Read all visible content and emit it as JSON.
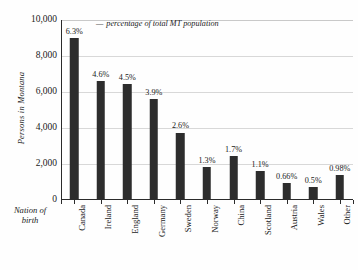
{
  "chart_data": {
    "type": "bar",
    "title": "",
    "xlabel": "Nation of birth",
    "ylabel": "Persons in Montana",
    "ylim": [
      0,
      10000
    ],
    "ytick_labels": [
      "10,000",
      "8,000",
      "6,000",
      "4,000",
      "2,000",
      "0"
    ],
    "ytick_values": [
      10000,
      8000,
      6000,
      4000,
      2000,
      0
    ],
    "grid": true,
    "legend_position": "inside-top-left",
    "annotation": "percentage of total MT population",
    "annotation_dash": "—",
    "categories": [
      "Canada",
      "Ireland",
      "England",
      "Germany",
      "Sweden",
      "Norway",
      "China",
      "Scotland",
      "Austria",
      "Wales",
      "Other"
    ],
    "values": [
      9000,
      6600,
      6450,
      5600,
      3750,
      1850,
      2450,
      1600,
      950,
      700,
      1400
    ],
    "point_labels": [
      "6.3%",
      "4.6%",
      "4.5%",
      "3.9%",
      "2.6%",
      "1.3%",
      "1.7%",
      "1.1%",
      "0.66%",
      "0.5%",
      "0.98%"
    ],
    "percent_values": [
      6.3,
      4.6,
      4.5,
      3.9,
      2.6,
      1.3,
      1.7,
      1.1,
      0.66,
      0.5,
      0.98
    ],
    "bar_color": "#2d2d2d",
    "grid_color": "#d8d8d8",
    "axis_color": "#2b2b2b",
    "background_color": "#fefefe"
  }
}
